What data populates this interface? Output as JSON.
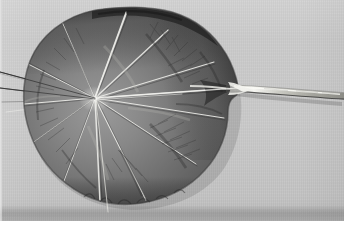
{
  "image": {
    "kind": "photograph",
    "subject": "large round leaf with radiating veins",
    "palette_mode": "grayscale",
    "colors": {
      "background_gray": "#c9c9c9",
      "background_highlight": "#d6d6d6",
      "plate_shadow_band": "#b4b4b4",
      "white_trim": "#ffffff",
      "leaf_mid": "#6f6f6f",
      "leaf_light": "#8d8d8d",
      "leaf_dark": "#3f3f3f",
      "leaf_darkest": "#262626",
      "vein_highlight": "#f2f2ef",
      "petiole_highlight": "#f4f4f0",
      "petiole_shadow": "#3a3a3a",
      "fiber_line": "#2e2e2e"
    },
    "dimensions": {
      "width": 344,
      "height": 227
    },
    "regions": [
      {
        "name": "studio-backdrop",
        "description": "flat light gray seamless backdrop filling the frame"
      },
      {
        "name": "leaf-blade",
        "description": "large orbicular leaf, roughly 225 px wide, centered slightly left of frame"
      },
      {
        "name": "leaf-apex-notch",
        "description": "pointed tip on the right side where the petiole joins the blade"
      },
      {
        "name": "petiole",
        "description": "pale stalk running right from the blade to the right frame edge"
      },
      {
        "name": "vein-hub",
        "description": "palmate vein convergence point left of blade center at about (95, 98)"
      },
      {
        "name": "fiber-lines",
        "description": "thin dark fibers / vein tips extending left past the blade margin to the frame edge"
      },
      {
        "name": "bottom-shadow-band",
        "description": "darker gray band across the lower edge of the print"
      },
      {
        "name": "white-border",
        "description": "thin white print trim along the bottom edge"
      }
    ],
    "leaf": {
      "blade_center": {
        "x": 128,
        "y": 104
      },
      "blade_width": 226,
      "blade_height": 196,
      "vein_hub": {
        "x": 95,
        "y": 98
      },
      "primary_vein_count": 13,
      "margin": "undulate / crinkled",
      "surface": "matte with herringbone secondary venation, brightest near the hub"
    },
    "petiole": {
      "start": {
        "x": 236,
        "y": 88
      },
      "end": {
        "x": 340,
        "y": 96
      },
      "description": "slender pale stalk with a bright specular highlight and dark lower shadow edge"
    }
  },
  "caption": {
    "title": "Round leaf, dorsal view",
    "note": "Monochrome studio photograph of a peltate leaf with palmate venation"
  }
}
